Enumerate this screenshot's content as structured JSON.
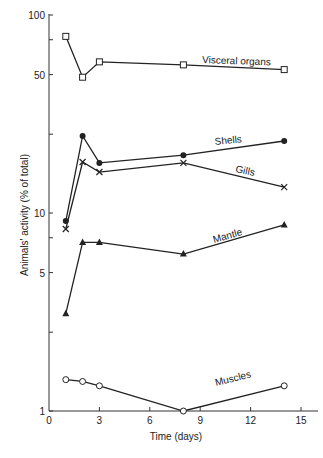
{
  "chart_data": {
    "type": "line",
    "title": "",
    "xlabel": "Time (days)",
    "ylabel": "Animals' activity (% of total)",
    "xlim": [
      0,
      16
    ],
    "ylim": [
      1,
      100
    ],
    "yscale": "log",
    "grid": false,
    "legend": "inline labels",
    "x_ticks": [
      0,
      3,
      6,
      9,
      12,
      15
    ],
    "y_ticks": [
      1,
      5,
      10,
      50,
      100
    ],
    "x": [
      1,
      2,
      3,
      8,
      14
    ],
    "series": [
      {
        "name": "Visceral organs",
        "marker": "open-square",
        "values": [
          78,
          48.5,
          58,
          56,
          53
        ]
      },
      {
        "name": "Shells",
        "marker": "filled-circle",
        "values": [
          9.1,
          24.5,
          17.9,
          19.6,
          23.1
        ]
      },
      {
        "name": "Gills",
        "marker": "cross",
        "values": [
          8.3,
          18.1,
          16.1,
          17.9,
          13.5
        ]
      },
      {
        "name": "Mantle",
        "marker": "filled-triangle",
        "values": [
          3.1,
          7.1,
          7.1,
          6.2,
          8.7
        ]
      },
      {
        "name": "Muscles",
        "marker": "open-circle",
        "values": [
          1.44,
          1.41,
          1.34,
          1.0,
          1.34
        ]
      }
    ]
  },
  "labels": {
    "visceral": "Visceral organs",
    "shells": "Shells",
    "gills": "Gills",
    "mantle": "Mantle",
    "muscles": "Muscles"
  }
}
